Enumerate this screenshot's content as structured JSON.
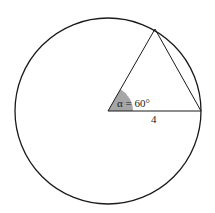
{
  "diagram": {
    "type": "circle-with-inscribed-triangle",
    "angle_label": "α = 60°",
    "radius_label": "4",
    "colors": {
      "stroke": "#1a1a1a",
      "angle_fill": "#a6a6a6",
      "background": "#ffffff"
    }
  }
}
